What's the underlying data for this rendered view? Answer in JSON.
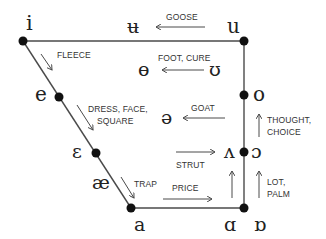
{
  "diagram": {
    "type": "vowel-chart",
    "colors": {
      "line": "#4a4a4a",
      "dot": "#111111",
      "text": "#222222",
      "label": "#333333",
      "background": "#ffffff"
    },
    "symbols": {
      "i": "i",
      "u_bar": "ʉ",
      "u": "u",
      "theta": "ɵ",
      "upsilon": "ʊ",
      "e": "e",
      "o": "o",
      "schwa": "ə",
      "epsilon": "ɛ",
      "wedge": "ʌ",
      "open_o": "ɔ",
      "ae": "æ",
      "a": "a",
      "script_a": "ɑ",
      "turned_script_a": "ɒ"
    },
    "labels": {
      "goose": "GOOSE",
      "fleece": "FLEECE",
      "foot_cure": "FOOT, CURE",
      "dress_face": "DRESS, FACE,",
      "square": "SQUARE",
      "goat": "GOAT",
      "thought": "THOUGHT,",
      "choice": "CHOICE",
      "strut": "STRUT",
      "trap": "TRAP",
      "price": "PRICE",
      "lot": "LOT,",
      "palm": "PALM"
    }
  }
}
